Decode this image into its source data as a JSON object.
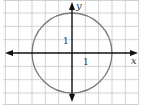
{
  "diagram": {
    "type": "coordinate-plane-circle",
    "grid": {
      "unit_px": 13.33,
      "origin_px": [
        72,
        53
      ],
      "x_range_units": [
        -5,
        5
      ],
      "y_range_units": [
        -4,
        4
      ],
      "line_color": "#cfcfcf"
    },
    "axes": {
      "x_label": "x",
      "y_label": "y",
      "color": "#111111"
    },
    "tick_labels": {
      "x_one": "1",
      "y_one": "1"
    },
    "circle": {
      "center": [
        0,
        0
      ],
      "radius": 3,
      "stroke_color": "#7a7a7a"
    }
  }
}
